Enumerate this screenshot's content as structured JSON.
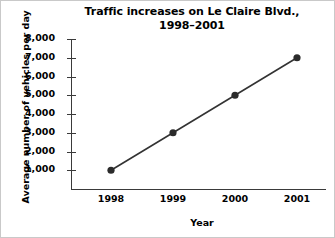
{
  "chart_data": {
    "type": "line",
    "title": "Traffic increases on Le Claire Blvd., 1998–2001",
    "title_line1": "Traffic increases on Le Claire Blvd.,",
    "title_line2": "1998–2001",
    "xlabel": "Year",
    "ylabel": "Average number of vehicles per day",
    "categories": [
      "1998",
      "1999",
      "2000",
      "2001"
    ],
    "x": [
      1998,
      1999,
      2000,
      2001
    ],
    "values": [
      1000,
      3000,
      5000,
      7000
    ],
    "series": [
      {
        "name": "Average number of vehicles per day",
        "values": [
          1000,
          3000,
          5000,
          7000
        ]
      }
    ],
    "ylim": [
      0,
      8000
    ],
    "ytick_labels": [
      "8,000",
      "7,000",
      "6,000",
      "5,000",
      "4,000",
      "3,000",
      "2,000",
      "1,000"
    ],
    "ytick_values": [
      8000,
      7000,
      6000,
      5000,
      4000,
      3000,
      2000,
      1000
    ],
    "xtick_labels": [
      "1998",
      "1999",
      "2000",
      "2001"
    ],
    "grid": false,
    "legend": "none",
    "line_color": "#333333",
    "marker_color": "#2b2b2b",
    "axis_color": "#3a3a3a",
    "background_color": "#ffffff"
  }
}
